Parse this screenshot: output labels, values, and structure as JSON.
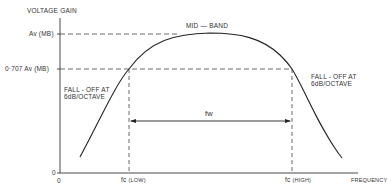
{
  "diagram": {
    "y_axis_label": "VOLTAGE GAIN",
    "x_axis_label": "FREQUENCY",
    "origin_y_label": "0",
    "origin_x_label": "0",
    "levels": {
      "av_mb": "Av (MB)",
      "av_707": "0·707 Av (MB)"
    },
    "mid_band_label": "MID — BAND",
    "fall_off_left": [
      "FALL - OFF AT",
      "6dB/OCTAVE"
    ],
    "fall_off_right": [
      "FALL - OFF AT",
      "6dB/OCTAVE"
    ],
    "bandwidth_label": "fw",
    "fc_low": {
      "main": "fc",
      "sub": "(LOW)"
    },
    "fc_high": {
      "main": "fc",
      "sub": "(HIGH)"
    },
    "colors": {
      "ink": "#2a2a2a",
      "background": "#ffffff"
    }
  }
}
